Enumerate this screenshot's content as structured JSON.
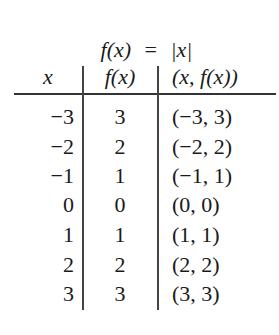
{
  "title": {
    "func": "f(x)",
    "equals": "=",
    "expr": "|x|"
  },
  "table": {
    "headers": [
      "x",
      "f(x)",
      "(x, f(x))"
    ],
    "rows": [
      {
        "x": "−3",
        "fx": "3",
        "pair": "(−3, 3)"
      },
      {
        "x": "−2",
        "fx": "2",
        "pair": "(−2, 2)"
      },
      {
        "x": "−1",
        "fx": "1",
        "pair": "(−1, 1)"
      },
      {
        "x": "0",
        "fx": "0",
        "pair": "(0, 0)"
      },
      {
        "x": "1",
        "fx": "1",
        "pair": "(1, 1)"
      },
      {
        "x": "2",
        "fx": "2",
        "pair": "(2, 2)"
      },
      {
        "x": "3",
        "fx": "3",
        "pair": "(3, 3)"
      }
    ]
  }
}
